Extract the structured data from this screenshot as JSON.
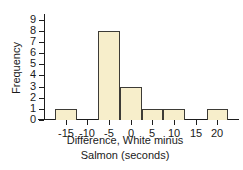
{
  "chart_data": {
    "type": "bar",
    "title": "",
    "subtitle": "",
    "xlabel": "Difference, White minus Salmon (seconds)",
    "xlabel_line1": "Difference, White minus",
    "xlabel_line2": "Salmon (seconds)",
    "ylabel": "Frequency",
    "xlim": [
      -20,
      25
    ],
    "ylim": [
      0,
      9.5
    ],
    "grid": false,
    "legend": null,
    "bin_width": 5,
    "x_ticks": [
      "-15",
      "-10",
      "-5",
      "0",
      "5",
      "10",
      "15",
      "20"
    ],
    "x_tick_values": [
      -15,
      -10,
      -5,
      0,
      5,
      10,
      15,
      20
    ],
    "y_ticks": [
      "0",
      "1",
      "2",
      "3",
      "4",
      "5",
      "6",
      "7",
      "8",
      "9"
    ],
    "y_tick_values": [
      0,
      1,
      2,
      3,
      4,
      5,
      6,
      7,
      8,
      9
    ],
    "bins": [
      {
        "left": -17.5,
        "right": -12.5,
        "value": 1
      },
      {
        "left": -12.5,
        "right": -7.5,
        "value": 0
      },
      {
        "left": -7.5,
        "right": -2.5,
        "value": 8
      },
      {
        "left": -2.5,
        "right": 2.5,
        "value": 3
      },
      {
        "left": 2.5,
        "right": 7.5,
        "value": 1
      },
      {
        "left": 7.5,
        "right": 12.5,
        "value": 1
      },
      {
        "left": 12.5,
        "right": 17.5,
        "value": 0
      },
      {
        "left": 17.5,
        "right": 22.5,
        "value": 1
      }
    ],
    "categories": [
      "-17.5 to -12.5",
      "-12.5 to -7.5",
      "-7.5 to -2.5",
      "-2.5 to 2.5",
      "2.5 to 7.5",
      "7.5 to 12.5",
      "12.5 to 17.5",
      "17.5 to 22.5"
    ],
    "values": [
      1,
      0,
      8,
      3,
      1,
      1,
      0,
      1
    ],
    "colors": {
      "bar_fill": "#f7eecb",
      "bar_edge": "#3d3b36",
      "axis": "#1d1d1d",
      "background": "#ffffff",
      "text": "#1a1a1a"
    }
  }
}
